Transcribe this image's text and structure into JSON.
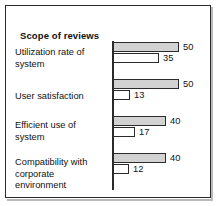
{
  "chart_data": {
    "type": "bar",
    "orientation": "horizontal",
    "title": "Scope of reviews",
    "xlabel": "",
    "ylabel": "",
    "grid": false,
    "legend": null,
    "axis_line": "vertical-left",
    "xlim": [
      0,
      50
    ],
    "categories": [
      "Utilization rate of system",
      "User satisfaction",
      "Efficient use of system",
      "Compatibility with corporate environment"
    ],
    "series": [
      {
        "name": "gray",
        "fill": "#d2d2d2",
        "values": [
          50,
          50,
          40,
          40
        ]
      },
      {
        "name": "white",
        "fill": "#ffffff",
        "values": [
          35,
          13,
          17,
          12
        ]
      }
    ],
    "groups": [
      {
        "label_lines": [
          "Utilization rate of",
          "system"
        ],
        "bars": [
          {
            "value": 50,
            "value_label": "50",
            "style": "gray"
          },
          {
            "value": 35,
            "value_label": "35",
            "style": "white"
          }
        ]
      },
      {
        "label_lines": [
          "User satisfaction"
        ],
        "bars": [
          {
            "value": 50,
            "value_label": "50",
            "style": "gray"
          },
          {
            "value": 13,
            "value_label": "13",
            "style": "white"
          }
        ]
      },
      {
        "label_lines": [
          "Efficient use of",
          "system"
        ],
        "bars": [
          {
            "value": 40,
            "value_label": "40",
            "style": "gray"
          },
          {
            "value": 17,
            "value_label": "17",
            "style": "white"
          }
        ]
      },
      {
        "label_lines": [
          "Compatibility with",
          "corporate",
          "environment"
        ],
        "bars": [
          {
            "value": 40,
            "value_label": "40",
            "style": "gray"
          },
          {
            "value": 12,
            "value_label": "12",
            "style": "white"
          }
        ]
      }
    ]
  },
  "colors": {
    "frame": "#2b2b2b",
    "bar_gray": "#d2d2d2",
    "bar_white": "#ffffff",
    "bar_border": "#2b2b2b",
    "text": "#111111",
    "background": "#ffffff"
  }
}
